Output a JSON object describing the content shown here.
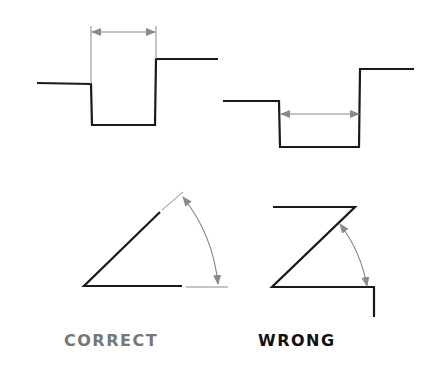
{
  "labels": {
    "correct": "CORRECT",
    "wrong": "WRONG"
  },
  "colors": {
    "object_line": "#1a1a1a",
    "dimension_line": "#8a8a8a",
    "correct_text": "#777777",
    "wrong_text": "#111111"
  },
  "diagram": {
    "examples": [
      {
        "kind": "linear-dimension",
        "verdict": "correct",
        "note": "dimension placed outside the notch using extension lines"
      },
      {
        "kind": "linear-dimension",
        "verdict": "wrong",
        "note": "dimension placed inside the notch between object lines"
      },
      {
        "kind": "angular-dimension",
        "verdict": "correct",
        "note": "angle dimensioned with extension lines beyond the object"
      },
      {
        "kind": "angular-dimension",
        "verdict": "wrong",
        "note": "angle dimensioned directly to object lines"
      }
    ]
  }
}
